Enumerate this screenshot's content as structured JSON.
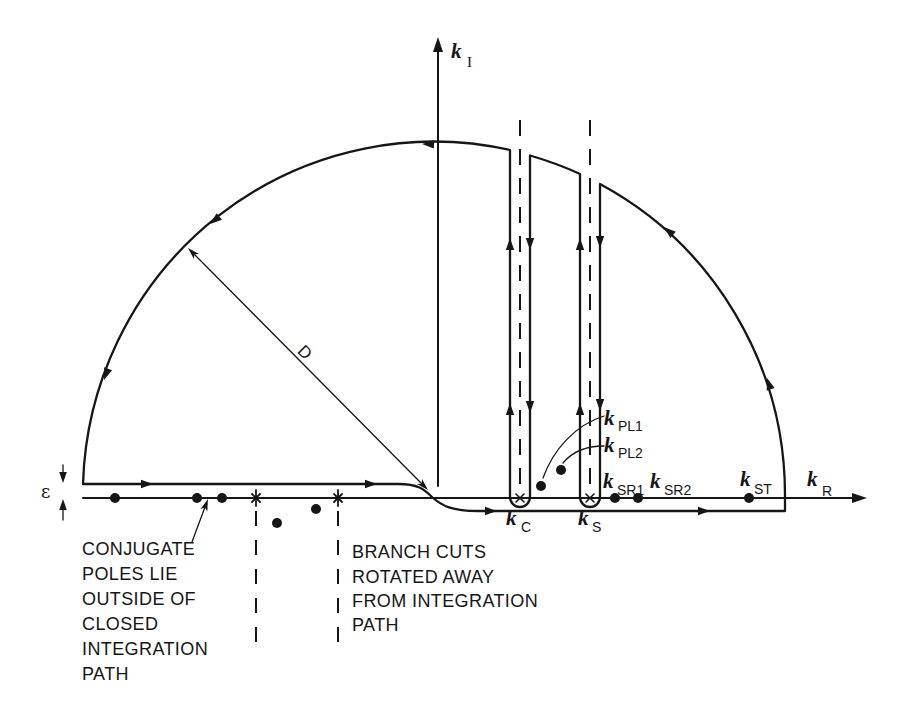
{
  "figure": {
    "axes": {
      "imaginary": {
        "symbol": "k",
        "subscript": "I"
      },
      "real": {
        "symbol": "k",
        "subscript": "R"
      }
    },
    "radius_label": "D",
    "epsilon_label": "ε",
    "points": {
      "kC": {
        "symbol": "k",
        "subscript": "C"
      },
      "kS": {
        "symbol": "k",
        "subscript": "S"
      },
      "kSR1": {
        "symbol": "k",
        "subscript": "SR1"
      },
      "kSR2": {
        "symbol": "k",
        "subscript": "SR2"
      },
      "kST": {
        "symbol": "k",
        "subscript": "ST"
      },
      "kPL1": {
        "symbol": "k",
        "subscript": "PL1"
      },
      "kPL2": {
        "symbol": "k",
        "subscript": "PL2"
      }
    },
    "annotations": {
      "conjugate_poles": [
        "CONJUGATE",
        "POLES LIE",
        "OUTSIDE OF",
        "CLOSED",
        "INTEGRATION",
        "PATH"
      ],
      "branch_cuts": [
        "BRANCH CUTS",
        "ROTATED AWAY",
        "FROM INTEGRATION",
        "PATH"
      ]
    },
    "colors": {
      "ink": "#161616",
      "background": "#ffffff"
    }
  }
}
